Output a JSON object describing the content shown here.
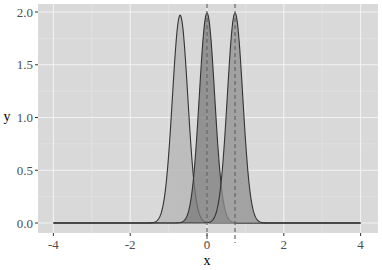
{
  "chart_data": {
    "type": "area",
    "title": "",
    "xlabel": "x",
    "ylabel": "y",
    "xlim": [
      -4.2,
      4.5
    ],
    "ylim": [
      -0.1,
      2.1
    ],
    "x_ticks": [
      -4,
      -2,
      0,
      2,
      4
    ],
    "x_tick_labels": [
      "-4",
      "-2",
      "0",
      "2",
      "4"
    ],
    "y_ticks": [
      0.0,
      0.5,
      1.0,
      1.5,
      2.0
    ],
    "y_tick_labels": [
      "0.0",
      "0.5",
      "1.0",
      "1.5",
      "2.0"
    ],
    "grid": true,
    "legend": null,
    "x_range_drawn": [
      -4,
      4
    ],
    "series": [
      {
        "name": "density-left",
        "distribution": "normal",
        "mean": -0.7,
        "sd": 0.2,
        "peak": 1.97,
        "fill": "#b3b3b3",
        "fill_opacity": 0.75,
        "line": "#333333"
      },
      {
        "name": "density-center",
        "distribution": "normal",
        "mean": 0.0,
        "sd": 0.2,
        "peak": 1.99,
        "fill": "#7a7a7a",
        "fill_opacity": 0.75,
        "line": "#333333"
      },
      {
        "name": "density-right",
        "distribution": "normal",
        "mean": 0.73,
        "sd": 0.2,
        "peak": 1.99,
        "fill": "#8f8f8f",
        "fill_opacity": 0.75,
        "line": "#333333"
      }
    ],
    "vlines": [
      {
        "x": 0.0,
        "style": "dashed",
        "color": "#666666"
      },
      {
        "x": 0.73,
        "style": "dashed",
        "color": "#666666"
      }
    ]
  },
  "style": {
    "panel_background": "#d9d9d9",
    "grid_major": "#f2f2f2",
    "grid_minor": "#e6e6e6"
  }
}
